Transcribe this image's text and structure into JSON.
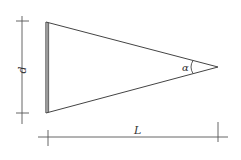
{
  "diagram": {
    "type": "geometry",
    "shape": "isosceles triangle (wedge)",
    "labels": {
      "height": "d",
      "length": "L",
      "angle": "α"
    },
    "colors": {
      "stroke": "#444444",
      "background": "#ffffff"
    }
  }
}
